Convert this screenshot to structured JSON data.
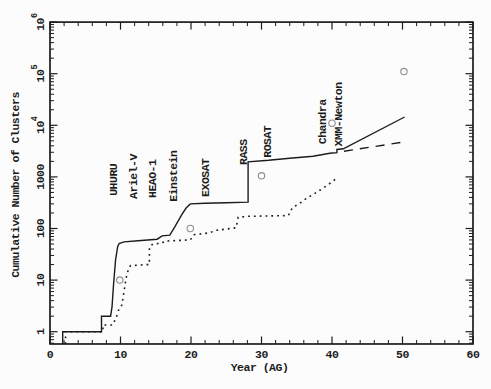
{
  "chart_data": {
    "type": "line",
    "title": "",
    "xlabel": "Year (AG)",
    "ylabel": "Cumulative Number of Clusters",
    "grid": false,
    "legend": "none",
    "x_axis": {
      "min": 0,
      "max": 60,
      "major_ticks": [
        0,
        10,
        20,
        30,
        40,
        50,
        60
      ],
      "minor_step": 2
    },
    "y_axis": {
      "scale": "log",
      "min": 0.578,
      "max": 1000000,
      "major_ticks": [
        {
          "value": 1,
          "label": "1"
        },
        {
          "value": 10,
          "label": "10"
        },
        {
          "value": 100,
          "label": "100"
        },
        {
          "value": 1000,
          "label": "1000"
        },
        {
          "value": 10000,
          "label": "10",
          "exp": "4"
        },
        {
          "value": 100000,
          "label": "10",
          "exp": "5"
        },
        {
          "value": 1000000,
          "label": "10",
          "exp": "6"
        }
      ]
    },
    "series": [
      {
        "name": "xray-cumulative-solid",
        "style": "solid",
        "points": [
          [
            1.8,
            0.578
          ],
          [
            1.8,
            1
          ],
          [
            7.3,
            1
          ],
          [
            7.3,
            2
          ],
          [
            8.6,
            2
          ],
          [
            8.8,
            3
          ],
          [
            9.0,
            8
          ],
          [
            9.3,
            25
          ],
          [
            9.6,
            45
          ],
          [
            9.8,
            51
          ],
          [
            10.5,
            55
          ],
          [
            12.5,
            58
          ],
          [
            15.2,
            62
          ],
          [
            15.9,
            72
          ],
          [
            17.0,
            74
          ],
          [
            17.7,
            108
          ],
          [
            18.7,
            185
          ],
          [
            19.3,
            250
          ],
          [
            19.9,
            300
          ],
          [
            22.0,
            308
          ],
          [
            25.0,
            315
          ],
          [
            28.1,
            325
          ],
          [
            28.1,
            1960
          ],
          [
            31.0,
            2100
          ],
          [
            34.0,
            2300
          ],
          [
            37.3,
            2520
          ],
          [
            39.7,
            2880
          ],
          [
            40.7,
            2950
          ],
          [
            40.7,
            3400
          ],
          [
            41.6,
            3500
          ],
          [
            50.3,
            14500
          ]
        ]
      },
      {
        "name": "projection-dashed",
        "style": "dashed",
        "points": [
          [
            41.7,
            3150
          ],
          [
            50.5,
            4800
          ]
        ]
      },
      {
        "name": "optical-cumulative-dotted",
        "style": "dotted",
        "points": [
          [
            2.2,
            0.578
          ],
          [
            2.2,
            1
          ],
          [
            7.5,
            1
          ],
          [
            7.5,
            1.35
          ],
          [
            8.9,
            1.35
          ],
          [
            9.4,
            1.9
          ],
          [
            9.8,
            2.8
          ],
          [
            10.2,
            3.3
          ],
          [
            10.5,
            6
          ],
          [
            10.8,
            11
          ],
          [
            11.1,
            16
          ],
          [
            11.4,
            19
          ],
          [
            13.7,
            20
          ],
          [
            14.1,
            20
          ],
          [
            14.1,
            44
          ],
          [
            14.6,
            50
          ],
          [
            15.9,
            52
          ],
          [
            16.2,
            57
          ],
          [
            19.9,
            60
          ],
          [
            20.4,
            76
          ],
          [
            22.6,
            82
          ],
          [
            23.5,
            92
          ],
          [
            26.4,
            103
          ],
          [
            26.7,
            165
          ],
          [
            28.2,
            172
          ],
          [
            33.8,
            178
          ],
          [
            34.4,
            255
          ],
          [
            35.4,
            305
          ],
          [
            36.4,
            385
          ],
          [
            37.4,
            465
          ],
          [
            38.4,
            565
          ],
          [
            39.4,
            700
          ],
          [
            40.1,
            820
          ],
          [
            40.7,
            950
          ]
        ]
      },
      {
        "name": "decade-circles",
        "style": "circles",
        "points": [
          [
            9.9,
            10
          ],
          [
            19.9,
            100
          ],
          [
            30.0,
            1050
          ],
          [
            40.0,
            11000
          ],
          [
            50.2,
            110000
          ]
        ]
      }
    ],
    "mission_labels": [
      {
        "label": "UHURU",
        "year": 8.95,
        "value": 430
      },
      {
        "label": "Ariel-V",
        "year": 11.8,
        "value": 375
      },
      {
        "label": "HEAO-1",
        "year": 14.6,
        "value": 390
      },
      {
        "label": "Einstein",
        "year": 17.5,
        "value": 330
      },
      {
        "label": "EXOSAT",
        "year": 22.0,
        "value": 410
      },
      {
        "label": "RASS",
        "year": 27.4,
        "value": 1700
      },
      {
        "label": "ROSAT",
        "year": 30.9,
        "value": 2350
      },
      {
        "label": "Chandra",
        "year": 38.7,
        "value": 4300
      },
      {
        "label": "XMM-Newton",
        "year": 40.9,
        "value": 3900
      }
    ],
    "colors": {
      "line": "#1c1c1c",
      "circle": "#8f8f8f",
      "background": "#fcfcfc"
    }
  }
}
